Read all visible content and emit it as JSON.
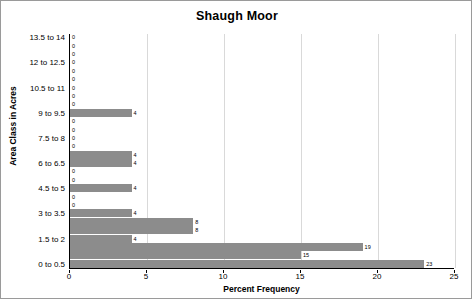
{
  "chart_data": {
    "type": "bar",
    "orientation": "horizontal",
    "title": "Shaugh Moor",
    "xlabel": "Percent Frequency",
    "ylabel": "Area Class in Acres",
    "xlim": [
      0,
      25
    ],
    "xticks": [
      0,
      5,
      10,
      15,
      20,
      25
    ],
    "grid": true,
    "legend": false,
    "categories": [
      "0 to 0.5",
      "0.5 to 1",
      "1 to 1.5",
      "1.5 to 2",
      "2 to 2.5",
      "2.5 to 3",
      "3 to 3.5",
      "3.5 to 4",
      "4 to 4.5",
      "4.5 to 5",
      "5 to 5.5",
      "5.5 to 6",
      "6 to 6.5",
      "6.5 to 7",
      "7 to 7.5",
      "7.5 to 8",
      "8 to 8.5",
      "8.5 to 9",
      "9 to 9.5",
      "9.5 to 10",
      "10 to 10.5",
      "10.5 to 11",
      "11 to 11.5",
      "11.5 to 12",
      "12 to 12.5",
      "12.5 to 13",
      "13 to 13.5",
      "13.5 to 14"
    ],
    "ytick_labels": [
      "0 to 0.5",
      "1.5 to 2",
      "3 to 3.5",
      "4.5 to 5",
      "6 to 6.5",
      "7.5 to 8",
      "9 to 9.5",
      "10.5 to 11",
      "12 to 12.5",
      "13.5 to 14"
    ],
    "values": [
      23,
      15,
      19,
      4,
      8,
      8,
      4,
      0,
      0,
      4,
      0,
      0,
      4,
      4,
      0,
      0,
      0,
      0,
      4,
      0,
      0,
      0,
      0,
      0,
      0,
      0,
      0,
      0
    ],
    "value_labels": [
      "23",
      "15",
      "19",
      "4",
      "8",
      "8",
      "4",
      "0",
      "0",
      "4",
      "0",
      "0",
      "4",
      "4",
      "0",
      "0",
      "0",
      "0",
      "4",
      "0",
      "0",
      "0",
      "0",
      "0",
      "0",
      "0",
      "0",
      "0"
    ],
    "bar_color": "#8c8c8c",
    "grid_color": "#d9d9d9"
  }
}
